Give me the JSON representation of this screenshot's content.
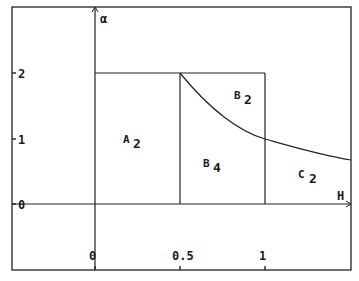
{
  "diagram": {
    "y_axis_label": "α",
    "x_axis_label": "H",
    "y_ticks": [
      {
        "label": "0",
        "value": 0
      },
      {
        "label": "1",
        "value": 1
      },
      {
        "label": "2",
        "value": 2
      }
    ],
    "x_ticks": [
      {
        "label": "0",
        "value": 0
      },
      {
        "label": "0.5",
        "value": 0.5
      },
      {
        "label": "1",
        "value": 1
      }
    ],
    "regions": [
      {
        "name": "A",
        "sub": "2"
      },
      {
        "name": "B",
        "sub": "4"
      },
      {
        "name": "B",
        "sub": "2"
      },
      {
        "name": "C",
        "sub": "2"
      }
    ],
    "curve": "α = 1/H",
    "line_color": "#1a1a1a"
  }
}
